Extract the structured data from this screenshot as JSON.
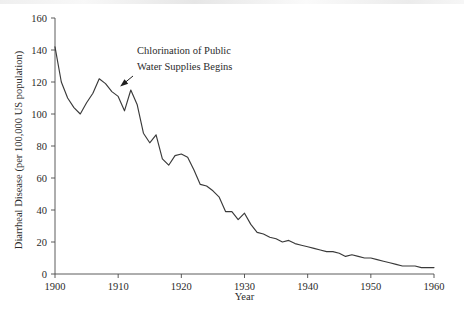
{
  "figure": {
    "background_color": "#ffffff",
    "line_color": "#3a3a3a",
    "axis_color": "#4a4a4a",
    "text_color": "#2b2b2b"
  },
  "annotation": {
    "line1": "Chlorination of Public",
    "line2": "Water Supplies Begins",
    "points_to_year": 1910,
    "points_to_value": 115
  },
  "chart_data": {
    "type": "line",
    "title": "",
    "subtitle": "",
    "xlabel": "Year",
    "ylabel": "Diarrheal Disease (per 100,000 US population)",
    "xlim": [
      1900,
      1960
    ],
    "ylim": [
      0,
      160
    ],
    "xticks": [
      1900,
      1910,
      1920,
      1930,
      1940,
      1950,
      1960
    ],
    "xtick_labels": [
      "1900",
      "1910",
      "1920",
      "1930",
      "1940",
      "1950",
      "1960"
    ],
    "yticks": [
      0,
      20,
      40,
      60,
      80,
      100,
      120,
      140,
      160
    ],
    "ytick_labels": [
      "0",
      "20",
      "40",
      "60",
      "80",
      "100",
      "120",
      "140",
      "160"
    ],
    "grid": false,
    "legend": null,
    "legend_position": "none",
    "series": [
      {
        "name": "Diarrheal Disease Death Rate",
        "x": [
          1900,
          1901,
          1902,
          1903,
          1904,
          1905,
          1906,
          1907,
          1908,
          1909,
          1910,
          1911,
          1912,
          1913,
          1914,
          1915,
          1916,
          1917,
          1918,
          1919,
          1920,
          1921,
          1922,
          1923,
          1924,
          1925,
          1926,
          1927,
          1928,
          1929,
          1930,
          1931,
          1932,
          1933,
          1934,
          1935,
          1936,
          1937,
          1938,
          1939,
          1940,
          1941,
          1942,
          1943,
          1944,
          1945,
          1946,
          1947,
          1948,
          1949,
          1950,
          1951,
          1952,
          1953,
          1954,
          1955,
          1956,
          1957,
          1958,
          1959,
          1960
        ],
        "values": [
          142,
          120,
          110,
          104,
          100,
          107,
          113,
          122,
          119,
          114,
          111,
          102,
          115,
          106,
          88,
          82,
          87,
          72,
          68,
          74,
          75,
          73,
          65,
          56,
          55,
          52,
          48,
          39,
          39,
          34,
          38,
          31,
          26,
          25,
          23,
          22,
          20,
          21,
          19,
          18,
          17,
          16,
          15,
          14,
          14,
          13,
          11,
          12,
          11,
          10,
          10,
          9,
          8,
          7,
          6,
          5,
          5,
          5,
          4,
          4,
          4
        ]
      }
    ]
  }
}
